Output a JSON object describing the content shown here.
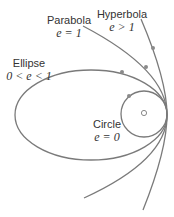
{
  "diagram": {
    "colors": {
      "curve": "#7a7a7a",
      "text": "#333333",
      "dot": "#8a8a8a",
      "background": "#ffffff"
    },
    "labels": {
      "parabola": {
        "name": "Parabola",
        "condition": "e = 1"
      },
      "hyperbola": {
        "name": "Hyperbola",
        "condition": "e > 1"
      },
      "ellipse": {
        "name": "Ellipse",
        "condition": "0 < e < 1"
      },
      "circle": {
        "name": "Circle",
        "condition": "e = 0"
      }
    },
    "curves": [
      {
        "id": "circle",
        "eccentricity": "0"
      },
      {
        "id": "ellipse",
        "eccentricity": "0 < e < 1"
      },
      {
        "id": "parabola",
        "eccentricity": "1"
      },
      {
        "id": "hyperbola",
        "eccentricity": "> 1"
      }
    ],
    "focus": {
      "marker": "small-circle"
    },
    "common_vertex": "shared tangent point on the right"
  }
}
